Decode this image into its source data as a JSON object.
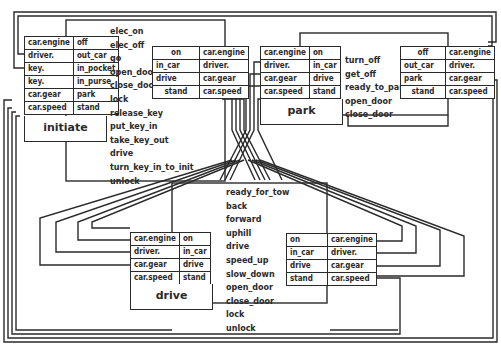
{
  "diagram": {
    "type": "state-machine",
    "states": {
      "initiate": {
        "name": "initiate",
        "variables": [
          {
            "var": "car.engine",
            "value": "off"
          },
          {
            "var": "driver.",
            "value": "out_car"
          },
          {
            "var": "key.",
            "value": "in_pocket"
          },
          {
            "var": "key.",
            "value": "in_purse"
          },
          {
            "var": "car.gear",
            "value": "park"
          },
          {
            "var": "car.speed",
            "value": "stand"
          }
        ],
        "events": [
          "elec_on",
          "elec_off",
          "go",
          "open_door",
          "close_door",
          "lock",
          "release_key",
          "put_key_in",
          "take_key_out",
          "drive",
          "turn_key_in_to_init",
          "unlock"
        ]
      },
      "park": {
        "name": "park",
        "variables": [
          {
            "var": "car.engine",
            "value": "on"
          },
          {
            "var": "driver.",
            "value": "in_car"
          },
          {
            "var": "car.gear",
            "value": "drive"
          },
          {
            "var": "car.speed",
            "value": "stand"
          }
        ],
        "events": [
          "turn_off",
          "get_off",
          "ready_to_park",
          "open_door",
          "close_door"
        ]
      },
      "drive": {
        "name": "drive",
        "variables": [
          {
            "var": "car.engine",
            "value": "on"
          },
          {
            "var": "driver.",
            "value": "in_car"
          },
          {
            "var": "car.gear",
            "value": "drive"
          },
          {
            "var": "car.speed",
            "value": "stand"
          }
        ],
        "events": [
          "ready_for_tow",
          "back",
          "forward",
          "uphill",
          "drive",
          "speed_up",
          "slow_down",
          "open_door",
          "close_door",
          "lock",
          "unlock"
        ]
      }
    },
    "transition_tables": {
      "initiate_to_park": [
        {
          "value": "on",
          "var": "car.engine"
        },
        {
          "value": "in_car",
          "var": "driver."
        },
        {
          "value": "drive",
          "var": "car.gear"
        },
        {
          "value": "stand",
          "var": "car.speed"
        }
      ],
      "park_to_initiate": [
        {
          "value": "off",
          "var": "car.engine"
        },
        {
          "value": "out_car",
          "var": "driver."
        },
        {
          "value": "park",
          "var": "car.gear"
        },
        {
          "value": "stand",
          "var": "car.speed"
        }
      ],
      "drive_to_drive": [
        {
          "value": "on",
          "var": "car.engine"
        },
        {
          "value": "in_car",
          "var": "driver."
        },
        {
          "value": "drive",
          "var": "car.gear"
        },
        {
          "value": "stand",
          "var": "car.speed"
        }
      ]
    }
  }
}
